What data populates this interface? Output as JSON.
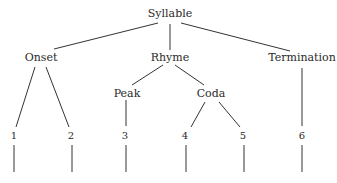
{
  "diagram": {
    "type": "tree",
    "root": {
      "label": "Syllable",
      "children": [
        {
          "label": "Onset",
          "children": [
            {
              "label": "1"
            },
            {
              "label": "2"
            }
          ]
        },
        {
          "label": "Rhyme",
          "children": [
            {
              "label": "Peak",
              "children": [
                {
                  "label": "3"
                }
              ]
            },
            {
              "label": "Coda",
              "children": [
                {
                  "label": "4"
                },
                {
                  "label": "5"
                }
              ]
            }
          ]
        },
        {
          "label": "Termination",
          "children": [
            {
              "label": "6"
            }
          ]
        }
      ]
    },
    "nodes": {
      "syllable": "Syllable",
      "onset": "Onset",
      "rhyme": "Rhyme",
      "termination": "Termination",
      "peak": "Peak",
      "coda": "Coda",
      "n1": "1",
      "n2": "2",
      "n3": "3",
      "n4": "4",
      "n5": "5",
      "n6": "6"
    },
    "line_color": "#333333"
  }
}
